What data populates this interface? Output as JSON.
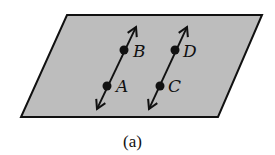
{
  "figure": {
    "caption": "(a)",
    "plane": {
      "fill": "#bdbdbd",
      "stroke": "#111111"
    },
    "lines": [
      {
        "points": [
          {
            "label": "B"
          },
          {
            "label": "A"
          }
        ]
      },
      {
        "points": [
          {
            "label": "D"
          },
          {
            "label": "C"
          }
        ]
      }
    ]
  }
}
